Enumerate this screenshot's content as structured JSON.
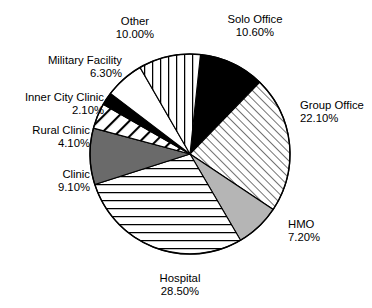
{
  "chart_data": {
    "type": "pie",
    "title": "",
    "subtitle": "",
    "xlabel": "",
    "ylabel": "",
    "legend_position": "none",
    "grid": false,
    "value_suffix": "%",
    "total": "100.00%",
    "categories": [
      "Solo Office",
      "Group Office",
      "HMO",
      "Hospital",
      "Clinic",
      "Rural Clinic",
      "Inner City Clinic",
      "Military Facility",
      "Other"
    ],
    "values": [
      10.6,
      22.1,
      7.2,
      28.5,
      9.1,
      4.1,
      2.1,
      6.3,
      10.0
    ],
    "slices": [
      {
        "label": "Solo Office",
        "value": 10.6,
        "value_text": "10.60%",
        "fill_style": "solid-black",
        "color": "#000000",
        "label_align": "center",
        "label_x": 205,
        "label_y": 13,
        "label_w": 100
      },
      {
        "label": "Group Office",
        "value": 22.1,
        "value_text": "22.10%",
        "fill_style": "diagonal-forward-hatch",
        "color": "#ffffff",
        "label_align": "left",
        "label_x": 300,
        "label_y": 99,
        "label_w": 90
      },
      {
        "label": "HMO",
        "value": 7.2,
        "value_text": "7.20%",
        "fill_style": "light-gray",
        "color": "#b5b5b5",
        "label_align": "left",
        "label_x": 288,
        "label_y": 218,
        "label_w": 70
      },
      {
        "label": "Hospital",
        "value": 28.5,
        "value_text": "28.50%",
        "fill_style": "horizontal-lines",
        "color": "#ffffff",
        "label_align": "center",
        "label_x": 135,
        "label_y": 272,
        "label_w": 90
      },
      {
        "label": "Clinic",
        "value": 9.1,
        "value_text": "9.10%",
        "fill_style": "dark-gray",
        "color": "#6a6a6a",
        "label_align": "right",
        "label_x": 16,
        "label_y": 168,
        "label_w": 74
      },
      {
        "label": "Rural Clinic",
        "value": 4.1,
        "value_text": "4.10%",
        "fill_style": "diagonal-back-thick",
        "color": "#ffffff",
        "label_align": "right",
        "label_x": 8,
        "label_y": 124,
        "label_w": 82
      },
      {
        "label": "Inner City Clinic",
        "value": 2.1,
        "value_text": "2.10%",
        "fill_style": "solid-black",
        "color": "#000000",
        "label_align": "right",
        "label_x": 0,
        "label_y": 91,
        "label_w": 104
      },
      {
        "label": "Military Facility",
        "value": 6.3,
        "value_text": "6.30%",
        "fill_style": "white",
        "color": "#ffffff",
        "label_align": "right",
        "label_x": 22,
        "label_y": 54,
        "label_w": 100
      },
      {
        "label": "Other",
        "value": 10.0,
        "value_text": "10.00%",
        "fill_style": "vertical-lines",
        "color": "#ffffff",
        "label_align": "center",
        "label_x": 97,
        "label_y": 15,
        "label_w": 76
      }
    ],
    "geometry": {
      "center_x": 190,
      "center_y": 154,
      "radius": 100,
      "start_angle_deg": -84
    }
  }
}
